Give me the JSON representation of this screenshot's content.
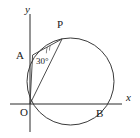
{
  "figure": {
    "kind": "circle-geometry-diagram",
    "background_color": "#ffffff",
    "line_color": "#3a3a3a",
    "axis_color": "#2b2b2b",
    "text_color": "#1a1a1a",
    "axes": {
      "x_axis_label": "x",
      "y_axis_label": "y",
      "origin_label": "O"
    },
    "points": [
      {
        "name": "O",
        "label": "O"
      },
      {
        "name": "A",
        "label": "A"
      },
      {
        "name": "P",
        "label": "P"
      },
      {
        "name": "B",
        "label": "B"
      }
    ],
    "labels": {
      "origin": "O",
      "point_a": "A",
      "point_p": "P",
      "point_b": "B",
      "x_axis": "x",
      "y_axis": "y",
      "angle": "30°"
    },
    "angle": {
      "vertex": "P",
      "rays": [
        "PA",
        "PO"
      ],
      "measure_text": "30°",
      "measure_value": 30,
      "unit": "degrees"
    },
    "segments": [
      {
        "name": "OA",
        "from": "O",
        "to": "A"
      },
      {
        "name": "OP",
        "from": "O",
        "to": "P"
      },
      {
        "name": "AP",
        "from": "A",
        "to": "P"
      }
    ],
    "circle": {
      "passes_through": [
        "O",
        "A",
        "P",
        "B"
      ]
    }
  },
  "geometry": {
    "view": {
      "width": 140,
      "height": 138
    },
    "origin": {
      "x": 30,
      "y": 104
    },
    "x_axis": {
      "x1": 10,
      "y1": 104,
      "x2": 122,
      "y2": 104
    },
    "y_axis": {
      "x1": 30,
      "y1": 14,
      "x2": 30,
      "y2": 132
    },
    "circle": {
      "cx": 70.5,
      "cy": 81.5,
      "r": 43.5
    },
    "point_a": {
      "x": 32.6,
      "y": 55.0
    },
    "point_p": {
      "x": 62.0,
      "y": 39.0
    },
    "point_b": {
      "x": 104.5,
      "y": 104.0
    },
    "angle_arc": {
      "cx": 62.0,
      "cy": 39.0,
      "r": 16
    },
    "label_positions": {
      "origin": {
        "x": 20,
        "y": 116
      },
      "point_a": {
        "x": 16,
        "y": 59
      },
      "point_p": {
        "x": 57,
        "y": 28
      },
      "point_b": {
        "x": 96,
        "y": 117
      },
      "x_axis": {
        "x": 126,
        "y": 101
      },
      "y_axis": {
        "x": 25,
        "y": 13
      },
      "angle": {
        "x": 36,
        "y": 64
      }
    }
  }
}
